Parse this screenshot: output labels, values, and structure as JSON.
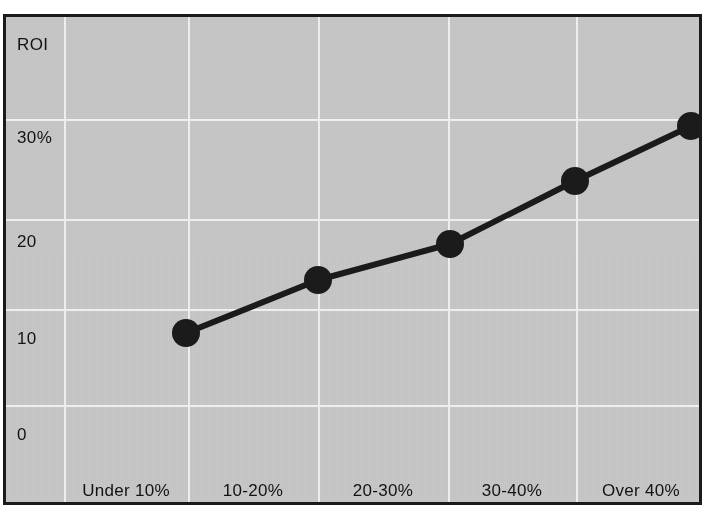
{
  "chart_data": {
    "type": "line",
    "title": "",
    "subtitle": "",
    "xlabel": "",
    "ylabel": "ROI",
    "categories": [
      "Under 10%",
      "10-20%",
      "20-30%",
      "30-40%",
      "Over 40%"
    ],
    "values": [
      10,
      15.5,
      19.5,
      25.5,
      31
    ],
    "series": [
      {
        "name": "ROI",
        "values": [
          10,
          15.5,
          19.5,
          25.5,
          31
        ]
      }
    ],
    "y_ticks": [
      "0",
      "10",
      "20",
      "30%"
    ],
    "y_tick_values": [
      0,
      10,
      20,
      30
    ],
    "ylim": [
      -4,
      40
    ],
    "xlim": [
      0,
      6
    ],
    "grid": true,
    "legend": "none",
    "marker": "filled-circle",
    "line_color": "#1b1b1b",
    "marker_color": "#1b1b1b",
    "plot_background": "#c9c9c9",
    "grid_color": "#f2f2f2",
    "frame_color": "#1b1b1b",
    "page_background": "#ffffff"
  },
  "axis": {
    "y_title": "ROI",
    "y_labels": [
      {
        "text": "30%",
        "value": 30
      },
      {
        "text": "20",
        "value": 20
      },
      {
        "text": "10",
        "value": 10
      },
      {
        "text": "0",
        "value": 0
      }
    ],
    "x_labels": [
      {
        "text": "Under 10%",
        "index": 0
      },
      {
        "text": "10-20%",
        "index": 1
      },
      {
        "text": "20-30%",
        "index": 2
      },
      {
        "text": "30-40%",
        "index": 3
      },
      {
        "text": "Over 40%",
        "index": 4
      }
    ]
  },
  "points": [
    {
      "label": "Under 10%",
      "value": 10,
      "cx": 180,
      "cy": 316
    },
    {
      "label": "10-20%",
      "value": 15.5,
      "cx": 312,
      "cy": 263
    },
    {
      "label": "20-30%",
      "value": 19.5,
      "cx": 444,
      "cy": 227
    },
    {
      "label": "30-40%",
      "value": 25.5,
      "cx": 569,
      "cy": 164
    },
    {
      "label": "Over 40%",
      "value": 31,
      "cx": 685,
      "cy": 109
    }
  ],
  "geometry": {
    "vertical_gridlines": [
      58,
      182,
      312,
      442,
      570
    ],
    "horizontal_gridlines": [
      102,
      202,
      292,
      388
    ]
  }
}
